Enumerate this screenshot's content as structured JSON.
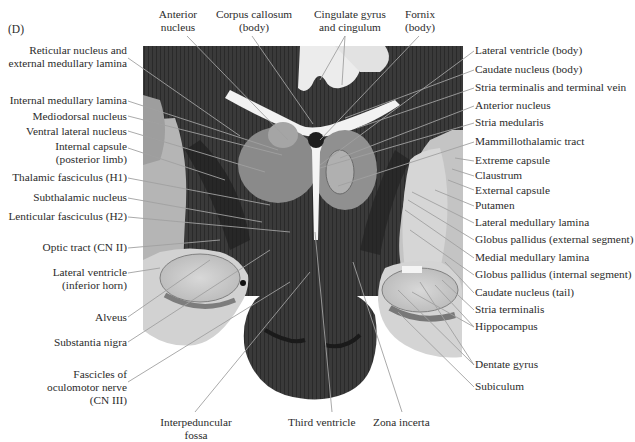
{
  "figure": {
    "panel_letter": "(D)"
  },
  "labels_top": [
    {
      "id": "anterior-nucleus-top",
      "lines": [
        "Anterior",
        "nucleus"
      ],
      "x": 178,
      "y": 8
    },
    {
      "id": "corpus-callosum",
      "lines": [
        "Corpus callosum",
        "(body)"
      ],
      "x": 252,
      "y": 8
    },
    {
      "id": "cingulate",
      "lines": [
        "Cingulate gyrus",
        "and cingulum"
      ],
      "x": 349,
      "y": 8
    },
    {
      "id": "fornix",
      "lines": [
        "Fornix",
        "(body)"
      ],
      "x": 419,
      "y": 8
    }
  ],
  "labels_left": [
    {
      "id": "reticular",
      "lines": [
        "Reticular nucleus and",
        "external medullary lamina"
      ],
      "right": 127,
      "y": 50
    },
    {
      "id": "internal-medullary-lamina",
      "lines": [
        "Internal medullary lamina"
      ],
      "right": 127,
      "y": 94
    },
    {
      "id": "mediodorsal",
      "lines": [
        "Mediodorsal nucleus"
      ],
      "right": 127,
      "y": 110
    },
    {
      "id": "ventral-lateral",
      "lines": [
        "Ventral lateral nucleus"
      ],
      "right": 127,
      "y": 125
    },
    {
      "id": "internal-capsule",
      "lines": [
        "Internal capsule",
        "(posterior limb)"
      ],
      "right": 127,
      "y": 140
    },
    {
      "id": "thalamic-fasciculus",
      "lines": [
        "Thalamic fasciculus (H1)"
      ],
      "right": 127,
      "y": 171
    },
    {
      "id": "subthalamic",
      "lines": [
        "Subthalamic nucleus"
      ],
      "right": 127,
      "y": 191
    },
    {
      "id": "lenticular-fasciculus",
      "lines": [
        "Lenticular fasciculus (H2)"
      ],
      "right": 127,
      "y": 210
    },
    {
      "id": "optic-tract",
      "lines": [
        "Optic tract (CN II)"
      ],
      "right": 127,
      "y": 241
    },
    {
      "id": "lateral-ventricle-inferior",
      "lines": [
        "Lateral ventricle",
        "(inferior horn)"
      ],
      "right": 127,
      "y": 266
    },
    {
      "id": "alveus",
      "lines": [
        "Alveus"
      ],
      "right": 127,
      "y": 310
    },
    {
      "id": "substantia-nigra",
      "lines": [
        "Substantia nigra"
      ],
      "right": 127,
      "y": 335
    },
    {
      "id": "fascicles-oculomotor",
      "lines": [
        "Fascicles of",
        "oculomotor nerve",
        "(CN III)"
      ],
      "right": 127,
      "y": 367
    }
  ],
  "labels_bottom": [
    {
      "id": "interpeduncular",
      "lines": [
        "Interpeduncular",
        "fossa"
      ],
      "x": 195,
      "y": 415
    },
    {
      "id": "third-ventricle",
      "lines": [
        "Third ventricle"
      ],
      "x": 332,
      "y": 415
    },
    {
      "id": "zona-incerta",
      "lines": [
        "Zona incerta"
      ],
      "x": 402,
      "y": 415
    }
  ],
  "labels_right": [
    {
      "id": "lateral-ventricle-body",
      "lines": [
        "Lateral ventricle (body)"
      ],
      "x": 475,
      "y": 44
    },
    {
      "id": "caudate-body",
      "lines": [
        "Caudate nucleus (body)"
      ],
      "x": 475,
      "y": 63
    },
    {
      "id": "stria-terminalis-vein",
      "lines": [
        "Stria terminalis and terminal vein"
      ],
      "x": 475,
      "y": 81
    },
    {
      "id": "anterior-nucleus-right",
      "lines": [
        "Anterior nucleus"
      ],
      "x": 475,
      "y": 99
    },
    {
      "id": "stria-medularis",
      "lines": [
        "Stria medularis"
      ],
      "x": 475,
      "y": 116
    },
    {
      "id": "mammillothalamic",
      "lines": [
        "Mammillothalamic tract"
      ],
      "x": 475,
      "y": 135
    },
    {
      "id": "extreme-capsule",
      "lines": [
        "Extreme capsule"
      ],
      "x": 475,
      "y": 154
    },
    {
      "id": "claustrum",
      "lines": [
        "Claustrum"
      ],
      "x": 475,
      "y": 169
    },
    {
      "id": "external-capsule",
      "lines": [
        "External capsule"
      ],
      "x": 475,
      "y": 183
    },
    {
      "id": "putamen",
      "lines": [
        "Putamen"
      ],
      "x": 475,
      "y": 199
    },
    {
      "id": "lateral-medullary-lamina",
      "lines": [
        "Lateral medullary lamina"
      ],
      "x": 475,
      "y": 216
    },
    {
      "id": "globus-pallidus-ext",
      "lines": [
        "Globus pallidus (external segment)"
      ],
      "x": 475,
      "y": 233
    },
    {
      "id": "medial-medullary-lamina",
      "lines": [
        "Medial medullary lamina"
      ],
      "x": 475,
      "y": 251
    },
    {
      "id": "globus-pallidus-int",
      "lines": [
        "Globus pallidus (internal segment)"
      ],
      "x": 475,
      "y": 268
    },
    {
      "id": "caudate-tail",
      "lines": [
        "Caudate nucleus (tail)"
      ],
      "x": 475,
      "y": 286
    },
    {
      "id": "stria-terminalis",
      "lines": [
        "Stria terminalis"
      ],
      "x": 475,
      "y": 303
    },
    {
      "id": "hippocampus",
      "lines": [
        "Hippocampus"
      ],
      "x": 475,
      "y": 320
    },
    {
      "id": "dentate-gyrus",
      "lines": [
        "Dentate gyrus"
      ],
      "x": 475,
      "y": 358
    },
    {
      "id": "subiculum",
      "lines": [
        "Subiculum"
      ],
      "x": 475,
      "y": 380
    }
  ],
  "colors": {
    "background": "#ffffff",
    "text": "#2b2b2b",
    "leader_line": "#9a9a9a",
    "tissue_dark": "#2e2e2e",
    "tissue_mid": "#6b6b6b",
    "tissue_light": "#bdbdbd",
    "white_matter": "#e6e6e6"
  }
}
